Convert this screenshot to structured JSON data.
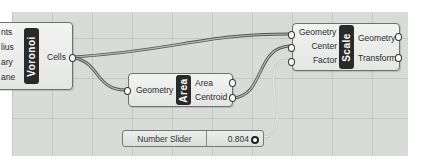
{
  "canvas": {
    "background": "#d9dbd9"
  },
  "components": {
    "voronoi": {
      "label": "Voronoi",
      "inputs": [
        "nts",
        "lius",
        "ary",
        "ane"
      ],
      "outputs": [
        "Cells"
      ]
    },
    "area": {
      "label": "Area",
      "inputs": [
        "Geometry"
      ],
      "outputs": [
        "Area",
        "Centroid"
      ]
    },
    "scale": {
      "label": "Scale",
      "inputs": [
        "Geometry",
        "Center",
        "Factor"
      ],
      "outputs": [
        "Geometry",
        "Transform"
      ]
    }
  },
  "slider": {
    "name": "Number Slider",
    "value": "0.804"
  }
}
